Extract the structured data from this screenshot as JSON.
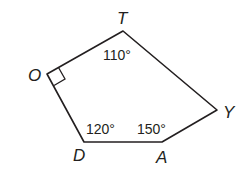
{
  "figure": {
    "shape": "pentagon",
    "vertices": [
      {
        "name": "T",
        "x": 123,
        "y": 31
      },
      {
        "name": "Y",
        "x": 217,
        "y": 110
      },
      {
        "name": "A",
        "x": 162,
        "y": 142
      },
      {
        "name": "D",
        "x": 84,
        "y": 142
      },
      {
        "name": "O",
        "x": 47,
        "y": 74
      }
    ],
    "vertex_labels": {
      "T": "T",
      "O": "O",
      "Y": "Y",
      "D": "D",
      "A": "A"
    },
    "angle_labels": {
      "T": "110°",
      "D": "120°",
      "A": "150°"
    },
    "right_angle_at": "O",
    "stroke_color": "#231f20"
  }
}
